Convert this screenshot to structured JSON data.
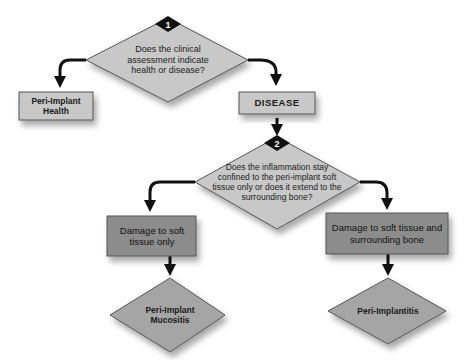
{
  "caption": "",
  "colors": {
    "light_fill": "#c8c8c8",
    "dark_fill": "#8c8c8c",
    "outcome_fill": "#a5a5a5",
    "stroke": "#555555",
    "arrow": "#111111",
    "badge": "#111111"
  },
  "nodes": {
    "q1": {
      "badge": "1",
      "text": "Does the clinical assessment indicate health or disease?"
    },
    "health": {
      "text": "Peri-Implant Health"
    },
    "disease": {
      "text": "DISEASE"
    },
    "q2": {
      "badge": "2",
      "text": "Does the inflammation stay confined to the peri-implant soft tissue only or does it extend to the surrounding bone?"
    },
    "soft_only": {
      "text": "Damage to soft tissue only"
    },
    "soft_bone": {
      "text": "Damage to soft tissue and surrounding bone"
    },
    "mucositis": {
      "text": "Peri-Implant Mucositis"
    },
    "implantitis": {
      "text": "Peri-Implantitis"
    }
  },
  "edges": [
    {
      "from": "q1",
      "to": "health"
    },
    {
      "from": "q1",
      "to": "disease"
    },
    {
      "from": "disease",
      "to": "q2"
    },
    {
      "from": "q2",
      "to": "soft_only"
    },
    {
      "from": "q2",
      "to": "soft_bone"
    },
    {
      "from": "soft_only",
      "to": "mucositis"
    },
    {
      "from": "soft_bone",
      "to": "implantitis"
    }
  ]
}
